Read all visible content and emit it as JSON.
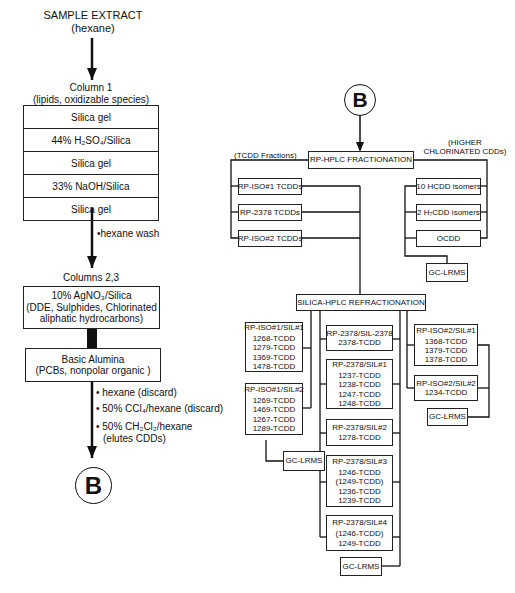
{
  "left_flow": {
    "title_line1": "SAMPLE EXTRACT",
    "title_line2": "(hexane)",
    "column1": {
      "title_line1": "Column 1",
      "title_line2": "(lipids, oxidizable species)",
      "layers": [
        "Silica gel",
        "44% H₂SO₄/Silica",
        "Silica gel",
        "33% NaOH/Silica",
        "Silica gel"
      ]
    },
    "wash_note": "•hexane wash",
    "columns23": {
      "title": "Columns 2,3",
      "box1_line1": "10% AgNO₃/Silica",
      "box1_line2": "(DDE, Sulphides, Chlorinated",
      "box1_line3": "aliphatic hydrocarbons)",
      "box2_line1": "Basic Alumina",
      "box2_line2": "(PCBs, nonpolar organic  )"
    },
    "elution_notes": [
      "• hexane (discard)",
      "• 50% CCl₄/hexane (discard)",
      "• 50% CH₂Cl₂/hexane",
      "(elutes CDDs)"
    ],
    "connector_label": "B"
  },
  "right_flow": {
    "connector_label": "B",
    "rp_hplc": "RP-HPLC FRACTIONATION",
    "tcdd_fractions_label": "(TCDD Fractions)",
    "higher_label_line1": "(HIGHER",
    "higher_label_line2": "CHLORINATED CDDs)",
    "tcdd_boxes": [
      "RP-ISO#1 TCDDs",
      "RP-2378 TCDDs",
      "RP-ISO#2 TCDDs"
    ],
    "higher_boxes": [
      "10 HCDD isomers",
      "2 H₇CDD isomers",
      "OCDD"
    ],
    "gc_lrms": "GC-LRMS",
    "silica_hplc": "SILICA-HPLC REFRACTIONATION",
    "iso1_groups": [
      {
        "title": "RP-ISO#1/SIL#1",
        "items": [
          "1268-TCDD",
          "1279-TCDD",
          "1369-TCDD",
          "1478-TCDD"
        ]
      },
      {
        "title": "RP-ISO#1/SIL#2",
        "items": [
          "1269-TCDD",
          "1469-TCDD",
          "1267-TCDD",
          "1289-TCDD"
        ]
      }
    ],
    "rp2378_groups": [
      {
        "title": "RP-2378/SIL-2378",
        "items": [
          "2378-TCDD"
        ]
      },
      {
        "title": "RP-2378/SIL#1",
        "items": [
          "1237-TCDD",
          "1238-TCDD",
          "1247-TCDD",
          "1248-TCDD"
        ]
      },
      {
        "title": "RP-2378/SIL#2",
        "items": [
          "1278-TCDD"
        ]
      },
      {
        "title": "RP-2378/SIL#3",
        "items": [
          "1246-TCDD",
          "(1249-TCDD)",
          "1236-TCDD",
          "1239-TCDD"
        ]
      },
      {
        "title": "RP-2378/SIL#4",
        "items": [
          "(1246-TCDD)",
          "1249-TCDD"
        ]
      }
    ],
    "iso2_groups": [
      {
        "title": "RP-ISO#2/SIL#1",
        "items": [
          "1368-TCDD",
          "1379-TCDD",
          "1378-TCDD"
        ]
      },
      {
        "title": "RP-ISO#2/SIL#2",
        "items": [
          "1234-TCDD"
        ]
      }
    ]
  }
}
